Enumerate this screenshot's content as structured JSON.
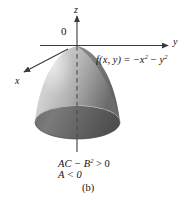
{
  "figure": {
    "panel_label": "(b)",
    "background_color": "#ffffff",
    "surface": {
      "name": "downward-opening-elliptic-paraboloid",
      "light_color": "#d8d8d8",
      "mid_color": "#a8a8a8",
      "dark_color": "#6e6e6e",
      "rim_color": "#585858"
    },
    "axes": {
      "z_label": "z",
      "y_label": "y",
      "x_label": "x",
      "origin_label": "0",
      "axis_color": "#3a3a3a"
    },
    "function_label": {
      "lhs": "f",
      "args": "(x, y)",
      "equals": " = ",
      "term1_base": "−x",
      "term1_exp": "2",
      "minus": " − ",
      "term2_base": "y",
      "term2_exp": "2",
      "full_text": "f(x, y) = −x2 − y2"
    },
    "conditions": {
      "line1_prefix": "AC − B",
      "line1_exp": "2",
      "line1_suffix": " > 0",
      "line2": "A < 0",
      "line1_full": "AC − B2 > 0"
    }
  }
}
